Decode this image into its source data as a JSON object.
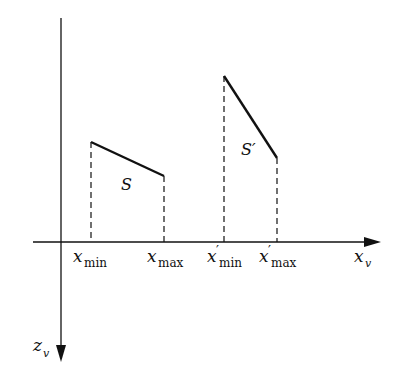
{
  "diagram": {
    "axes": {
      "horizontal_label": "x",
      "horizontal_sub": "v",
      "vertical_label": "z",
      "vertical_sub": "v"
    },
    "segments": [
      {
        "name": "S",
        "label": "S",
        "start": [
          91,
          142
        ],
        "end": [
          164,
          176
        ]
      },
      {
        "name": "S_prime",
        "label": "S′",
        "start": [
          224,
          76
        ],
        "end": [
          277,
          158
        ]
      }
    ],
    "ticks": [
      {
        "base": "x",
        "prime": "",
        "sub": "min"
      },
      {
        "base": "x",
        "prime": "",
        "sub": "max"
      },
      {
        "base": "x",
        "prime": "′",
        "sub": "min"
      },
      {
        "base": "x",
        "prime": "′",
        "sub": "max"
      }
    ],
    "colors": {
      "line": "#111111",
      "background": "#ffffff"
    }
  }
}
